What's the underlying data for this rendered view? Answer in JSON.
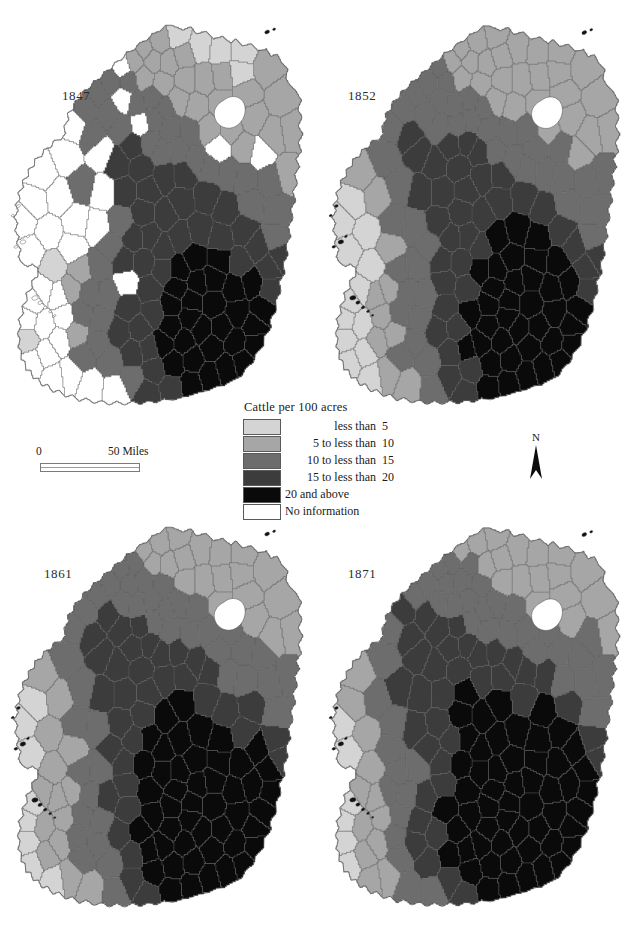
{
  "figure": {
    "type": "choropleth-map-series",
    "region": "Ireland",
    "variable": "Cattle per 100 acres"
  },
  "panels": [
    {
      "id": "1847",
      "year": "1847"
    },
    {
      "id": "1852",
      "year": "1852"
    },
    {
      "id": "1861",
      "year": "1861"
    },
    {
      "id": "1871",
      "year": "1871"
    }
  ],
  "legend": {
    "title": "Cattle per 100 acres",
    "classes": [
      {
        "label": "less than",
        "value": "5",
        "color": "#d4d4d4"
      },
      {
        "label": "5 to less than",
        "value": "10",
        "color": "#a6a6a6"
      },
      {
        "label": "10 to less than",
        "value": "15",
        "color": "#6d6d6d"
      },
      {
        "label": "15 to less than",
        "value": "20",
        "color": "#3c3c3c"
      },
      {
        "label": "20 and above",
        "value": "",
        "color": "#0a0a0a"
      },
      {
        "label": "No information",
        "value": "",
        "color": "#ffffff"
      }
    ]
  },
  "scalebar": {
    "zero_label": "0",
    "max_label": "50 Miles",
    "units": "Miles",
    "max_value": 50
  },
  "north_arrow": {
    "label": "N"
  },
  "chart_data": {
    "type": "heatmap",
    "title": "Cattle per 100 acres",
    "subtitle": "",
    "xlabel": "",
    "ylabel": "",
    "legend_position": "center",
    "grid": false,
    "categories": [
      "less than 5",
      "5 to less than 10",
      "10 to less than 15",
      "15 to less than 20",
      "20 and above",
      "No information"
    ],
    "class_colors": [
      "#d4d4d4",
      "#a6a6a6",
      "#6d6d6d",
      "#3c3c3c",
      "#0a0a0a",
      "#ffffff"
    ],
    "series": [
      {
        "name": "1847",
        "values": [
          18,
          31,
          44,
          34,
          26,
          22
        ]
      },
      {
        "name": "1852",
        "values": [
          14,
          38,
          46,
          38,
          37,
          2
        ]
      },
      {
        "name": "1861",
        "values": [
          9,
          36,
          45,
          40,
          45,
          0
        ]
      },
      {
        "name": "1871",
        "values": [
          8,
          33,
          42,
          41,
          51,
          0
        ]
      }
    ]
  }
}
